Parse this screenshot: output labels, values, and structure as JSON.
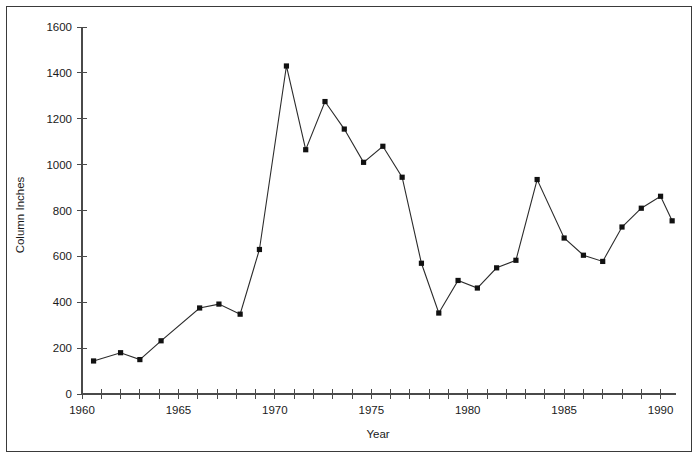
{
  "chart_data": {
    "type": "line",
    "title": "",
    "xlabel": "Year",
    "ylabel": "Column Inches",
    "xlim": [
      1960,
      1991
    ],
    "ylim": [
      0,
      1600
    ],
    "grid": false,
    "legend": false,
    "marker": "square",
    "line_color": "#2b2b2b",
    "marker_color": "#111111",
    "x_tick_interval": 1,
    "x_labeled_ticks": [
      "1960",
      "1965",
      "1970",
      "1975",
      "1980",
      "1985",
      "1990"
    ],
    "x_labeled_values": [
      1960,
      1965,
      1970,
      1975,
      1980,
      1985,
      1990
    ],
    "y_ticks": [
      0,
      200,
      400,
      600,
      800,
      1000,
      1200,
      1400,
      1600
    ],
    "y_tick_labels": [
      "0",
      "200",
      "400",
      "600",
      "800",
      "1000",
      "1200",
      "1400",
      "1600"
    ],
    "x": [
      1960.6,
      1962.0,
      1963.0,
      1964.1,
      1966.1,
      1967.1,
      1968.2,
      1969.2,
      1970.6,
      1971.6,
      1972.6,
      1973.6,
      1974.6,
      1975.6,
      1976.6,
      1977.6,
      1978.5,
      1979.5,
      1980.5,
      1981.5,
      1982.5,
      1983.6,
      1985.0,
      1986.0,
      1987.0,
      1988.0,
      1989.0,
      1990.0,
      1990.6
    ],
    "values": [
      144,
      180,
      150,
      232,
      375,
      392,
      348,
      630,
      1430,
      1065,
      1275,
      1155,
      1010,
      1080,
      945,
      570,
      353,
      495,
      462,
      550,
      583,
      935,
      680,
      605,
      578,
      728,
      810,
      862,
      755
    ],
    "series": [
      {
        "name": "Column Inches",
        "x": [
          1960.6,
          1962.0,
          1963.0,
          1964.1,
          1966.1,
          1967.1,
          1968.2,
          1969.2,
          1970.6,
          1971.6,
          1972.6,
          1973.6,
          1974.6,
          1975.6,
          1976.6,
          1977.6,
          1978.5,
          1979.5,
          1980.5,
          1981.5,
          1982.5,
          1983.6,
          1985.0,
          1986.0,
          1987.0,
          1988.0,
          1989.0,
          1990.0,
          1990.6
        ],
        "values": [
          144,
          180,
          150,
          232,
          375,
          392,
          348,
          630,
          1430,
          1065,
          1275,
          1155,
          1010,
          1080,
          945,
          570,
          353,
          495,
          462,
          550,
          583,
          935,
          680,
          605,
          578,
          728,
          810,
          862,
          755
        ]
      }
    ]
  }
}
